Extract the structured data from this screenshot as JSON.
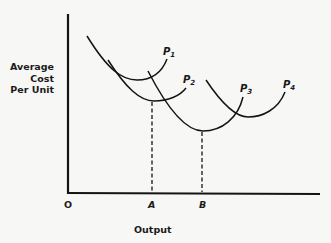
{
  "diagram": {
    "y_axis_label": [
      "Average",
      "Cost",
      "Per Unit"
    ],
    "x_axis_label": "Output",
    "origin_label": "O",
    "tick_labels": [
      {
        "label": "A",
        "x": 152
      },
      {
        "label": "B",
        "x": 202
      }
    ],
    "curves": [
      {
        "name": "P",
        "subscript": "1",
        "path": "M87,36 C108,70 122,80 137,80 C152,80 162,72 167,59",
        "label_x": 168,
        "label_y": 53
      },
      {
        "name": "P",
        "subscript": "2",
        "path": "M108,60 C126,88 140,101 154,101 C168,101 180,96 186,88",
        "label_x": 187,
        "label_y": 81
      },
      {
        "name": "P",
        "subscript": "3",
        "path": "M148,71 C168,110 186,131 203,131 C222,131 238,118 243,97",
        "label_x": 243,
        "label_y": 90
      },
      {
        "name": "P",
        "subscript": "4",
        "path": "M206,80 C222,104 236,117 248,117 C262,117 278,110 285,92",
        "label_x": 286,
        "label_y": 86
      }
    ],
    "dashed_lines": [
      {
        "x": 152,
        "y_top": 101,
        "label": "A"
      },
      {
        "x": 202,
        "y_top": 131,
        "label": "B"
      }
    ],
    "colors": {
      "ink": "#141414",
      "background": "#f7f7f5"
    }
  }
}
